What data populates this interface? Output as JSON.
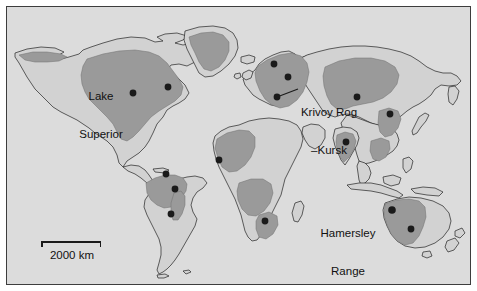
{
  "figure": {
    "type": "world-map",
    "frame": {
      "border_color": "#3d3d3d",
      "background_color": "#ffffff"
    }
  },
  "map": {
    "ocean_color": "#dcdcdc",
    "land_color": "#d2d2d2",
    "land_outline_color": "#222222",
    "region_color": "#9a9a9a",
    "locality_dot_color": "#1a1a1a",
    "leader_line_color": "#1a1a1a"
  },
  "labels": [
    {
      "id": "lake-superior",
      "text": "Lake\nSuperior",
      "line1": "Lake",
      "line2": "Superior"
    },
    {
      "id": "krivoy-rog-kursk",
      "text": "Krivoy Rog\n–Kursk",
      "line1": "Krivoy Rog",
      "line2": "–Kursk"
    },
    {
      "id": "hamersley-range",
      "text": "Hamersley\nRange",
      "line1": "Hamersley",
      "line2": "Range"
    }
  ],
  "scalebar": {
    "label": "2000 km",
    "length_km": 2000
  },
  "localities": [
    {
      "name": "Lake Superior",
      "region": "North America",
      "x": 131,
      "y": 91
    },
    {
      "name": "Labrador Trough",
      "region": "North America",
      "x": 166,
      "y": 85
    },
    {
      "name": "Carajas",
      "region": "South America",
      "x": 164,
      "y": 172
    },
    {
      "name": "Quadrilatero Ferrifero",
      "region": "South America",
      "x": 173,
      "y": 187
    },
    {
      "name": "Urucum",
      "region": "South America",
      "x": 169,
      "y": 212
    },
    {
      "name": "Kiruna",
      "region": "Europe",
      "x": 272,
      "y": 62
    },
    {
      "name": "Kostomuksha",
      "region": "Europe",
      "x": 286,
      "y": 75
    },
    {
      "name": "Krivoy Rog–Kursk",
      "region": "Europe",
      "x": 275,
      "y": 95
    },
    {
      "name": "Siberian district",
      "region": "Asia",
      "x": 355,
      "y": 95
    },
    {
      "name": "Sishen / Transvaal",
      "region": "Africa",
      "x": 217,
      "y": 158
    },
    {
      "name": "Thabazimbi",
      "region": "Africa",
      "x": 263,
      "y": 219
    },
    {
      "name": "Singhbhum / Bihar",
      "region": "Asia",
      "x": 344,
      "y": 140
    },
    {
      "name": "Anshan",
      "region": "Asia",
      "x": 388,
      "y": 112
    },
    {
      "name": "Hamersley Range",
      "region": "Australia",
      "x": 390,
      "y": 208
    },
    {
      "name": "Middleback Range",
      "region": "Australia",
      "x": 409,
      "y": 227
    }
  ],
  "ore_regions": [
    {
      "name": "North American shield",
      "area": "Canada–Lake Superior"
    },
    {
      "name": "Greenland shield",
      "area": "Greenland"
    },
    {
      "name": "Alaska belt",
      "area": "Alaska"
    },
    {
      "name": "Guiana / Amazon shield",
      "area": "Brazil–Venezuela"
    },
    {
      "name": "Brazilian shield",
      "area": "Minas Gerais"
    },
    {
      "name": "West African shield",
      "area": "West Africa"
    },
    {
      "name": "Congo–Kalahari shield",
      "area": "Central/Southern Africa"
    },
    {
      "name": "Fennoscandian shield",
      "area": "Scandinavia–Russia"
    },
    {
      "name": "Siberian shield",
      "area": "Central Siberia"
    },
    {
      "name": "Indian shield",
      "area": "India"
    },
    {
      "name": "North China craton",
      "area": "China"
    },
    {
      "name": "Pilbara / Yilgarn craton",
      "area": "Western Australia"
    }
  ]
}
